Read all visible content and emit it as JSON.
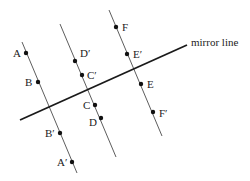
{
  "diagram": {
    "mirror_line": {
      "label": "mirror line",
      "x1": 20,
      "y1": 120,
      "x2": 187,
      "y2": 45,
      "label_x": 191,
      "label_y": 46
    },
    "perpendiculars": [
      {
        "id": "line-1",
        "x1": 22,
        "y1": 42,
        "x2": 77,
        "y2": 173
      },
      {
        "id": "line-2",
        "x1": 60,
        "y1": 24,
        "x2": 116,
        "y2": 157
      },
      {
        "id": "line-3",
        "x1": 109,
        "y1": 10,
        "x2": 162,
        "y2": 136
      }
    ],
    "points": [
      {
        "label": "A",
        "x": 26,
        "y": 53,
        "lx": 13,
        "ly": 57
      },
      {
        "label": "B",
        "x": 38,
        "y": 82,
        "lx": 25,
        "ly": 86
      },
      {
        "label": "B′",
        "x": 60,
        "y": 133,
        "lx": 45,
        "ly": 137
      },
      {
        "label": "A′",
        "x": 72,
        "y": 162,
        "lx": 57,
        "ly": 166
      },
      {
        "label": "D′",
        "x": 75,
        "y": 61,
        "lx": 80,
        "ly": 57
      },
      {
        "label": "C′",
        "x": 82,
        "y": 75,
        "lx": 87,
        "ly": 79
      },
      {
        "label": "C",
        "x": 95,
        "y": 105,
        "lx": 83,
        "ly": 109
      },
      {
        "label": "D",
        "x": 101,
        "y": 118,
        "lx": 89,
        "ly": 126
      },
      {
        "label": "F",
        "x": 116,
        "y": 27,
        "lx": 122,
        "ly": 31
      },
      {
        "label": "E′",
        "x": 127,
        "y": 54,
        "lx": 133,
        "ly": 58
      },
      {
        "label": "E",
        "x": 141,
        "y": 84,
        "lx": 147,
        "ly": 88
      },
      {
        "label": "F′",
        "x": 153,
        "y": 112,
        "lx": 159,
        "ly": 117
      }
    ]
  }
}
